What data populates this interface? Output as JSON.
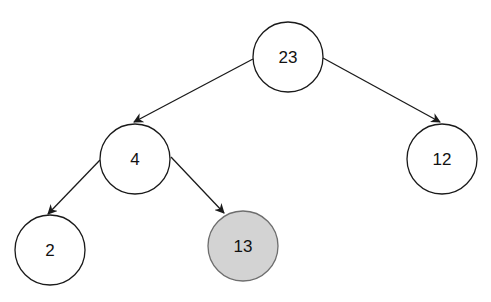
{
  "diagram": {
    "type": "binary-tree",
    "colors": {
      "stroke": "#1a1a1a",
      "node_fill": "#ffffff",
      "highlight_fill": "#d3d3d3",
      "highlight_stroke": "#6e6e6e"
    },
    "nodes": [
      {
        "id": "n23",
        "label": "23",
        "cx": 288,
        "cy": 57,
        "highlighted": false
      },
      {
        "id": "n4",
        "label": "4",
        "cx": 135,
        "cy": 159,
        "highlighted": false
      },
      {
        "id": "n12",
        "label": "12",
        "cx": 442,
        "cy": 159,
        "highlighted": false
      },
      {
        "id": "n2",
        "label": "2",
        "cx": 50,
        "cy": 250,
        "highlighted": false
      },
      {
        "id": "n13",
        "label": "13",
        "cx": 243,
        "cy": 246,
        "highlighted": true
      }
    ],
    "edges": [
      {
        "from": "23",
        "to": "4"
      },
      {
        "from": "23",
        "to": "12"
      },
      {
        "from": "4",
        "to": "2"
      },
      {
        "from": "4",
        "to": "13"
      }
    ]
  }
}
